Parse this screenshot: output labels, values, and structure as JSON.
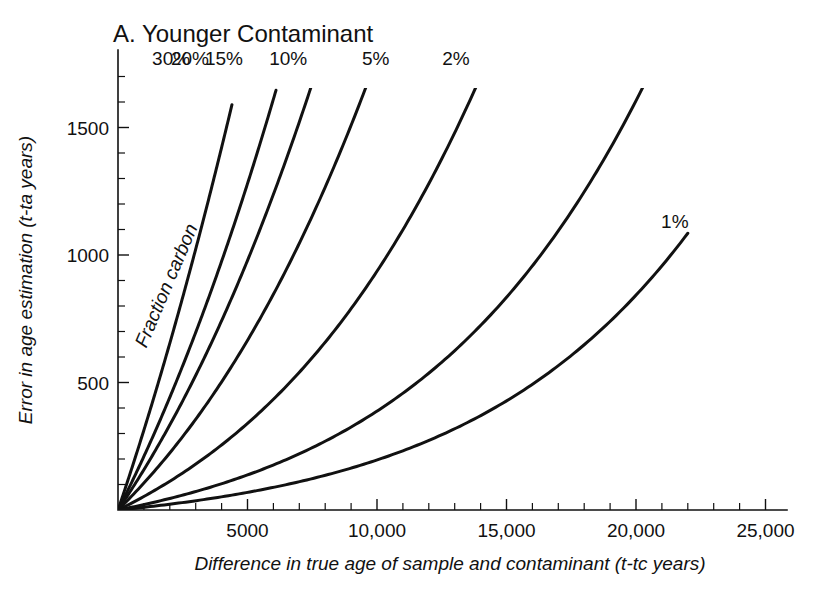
{
  "chart_data": {
    "type": "line",
    "title": "A. Younger Contaminant",
    "xlabel": "Difference in true age of sample and contaminant (t-tc years)",
    "ylabel": "Error in age estimation (t-ta years)",
    "xlim": [
      0,
      25800
    ],
    "ylim": [
      0,
      1750
    ],
    "xticks": [
      5000,
      10000,
      15000,
      20000,
      25000
    ],
    "xticklabels": [
      "5000",
      "10,000",
      "15,000",
      "20,000",
      "25,000"
    ],
    "yticks": [
      500,
      1000,
      1500
    ],
    "yticklabels": [
      "500",
      "1000",
      "1500"
    ],
    "x_minor_tick_step": 1000,
    "y_minor_tick_step": 100,
    "grid": false,
    "legend": "inline-curve-labels",
    "annotation": "Fraction carbon",
    "series_label_suffix": "%",
    "series": [
      {
        "name": "30%",
        "fraction": 0.3,
        "label": "30%",
        "label_x": 2050,
        "label_y": 1770,
        "end_x": 4400,
        "end_y": 1700,
        "values": [
          {
            "x": 0,
            "y": 0
          },
          {
            "x": 500,
            "y": 180
          },
          {
            "x": 1000,
            "y": 340
          },
          {
            "x": 1500,
            "y": 490
          },
          {
            "x": 2000,
            "y": 640
          },
          {
            "x": 2500,
            "y": 790
          },
          {
            "x": 3000,
            "y": 950
          },
          {
            "x": 3500,
            "y": 1120
          },
          {
            "x": 4000,
            "y": 1330
          },
          {
            "x": 4400,
            "y": 1700
          }
        ]
      },
      {
        "name": "20%",
        "fraction": 0.2,
        "label": "20%",
        "label_x": 2780,
        "label_y": 1770,
        "end_x": 6100,
        "end_y": 1700,
        "values": [
          {
            "x": 0,
            "y": 0
          },
          {
            "x": 1000,
            "y": 230
          },
          {
            "x": 2000,
            "y": 450
          },
          {
            "x": 3000,
            "y": 670
          },
          {
            "x": 3500,
            "y": 790
          },
          {
            "x": 4000,
            "y": 910
          },
          {
            "x": 4500,
            "y": 1040
          },
          {
            "x": 5000,
            "y": 1190
          },
          {
            "x": 5500,
            "y": 1370
          },
          {
            "x": 6100,
            "y": 1700
          }
        ]
      },
      {
        "name": "15%",
        "fraction": 0.15,
        "label": "15%",
        "label_x": 4090,
        "label_y": 1770,
        "end_x": 9300,
        "end_y": 1700,
        "values": [
          {
            "x": 0,
            "y": 0
          },
          {
            "x": 1000,
            "y": 160
          },
          {
            "x": 2000,
            "y": 320
          },
          {
            "x": 3000,
            "y": 480
          },
          {
            "x": 4000,
            "y": 640
          },
          {
            "x": 5000,
            "y": 800
          },
          {
            "x": 6000,
            "y": 960
          },
          {
            "x": 7000,
            "y": 1130
          },
          {
            "x": 8000,
            "y": 1320
          },
          {
            "x": 8700,
            "y": 1480
          },
          {
            "x": 9300,
            "y": 1700
          }
        ]
      },
      {
        "name": "10%",
        "fraction": 0.1,
        "label": "10%",
        "label_x": 6570,
        "label_y": 1770,
        "end_x": 13900,
        "end_y": 1700,
        "values": [
          {
            "x": 0,
            "y": 0
          },
          {
            "x": 2000,
            "y": 215
          },
          {
            "x": 4000,
            "y": 430
          },
          {
            "x": 6000,
            "y": 650
          },
          {
            "x": 8000,
            "y": 870
          },
          {
            "x": 10000,
            "y": 1100
          },
          {
            "x": 11500,
            "y": 1290
          },
          {
            "x": 12800,
            "y": 1490
          },
          {
            "x": 13900,
            "y": 1700
          }
        ]
      },
      {
        "name": "5%",
        "fraction": 0.05,
        "label": "5%",
        "label_x": 9950,
        "label_y": 1770,
        "end_x": 17400,
        "end_y": 1700,
        "values": [
          {
            "x": 0,
            "y": 0
          },
          {
            "x": 2500,
            "y": 185
          },
          {
            "x": 5000,
            "y": 375
          },
          {
            "x": 7500,
            "y": 570
          },
          {
            "x": 10000,
            "y": 780
          },
          {
            "x": 12500,
            "y": 1000
          },
          {
            "x": 14500,
            "y": 1200
          },
          {
            "x": 16000,
            "y": 1400
          },
          {
            "x": 17400,
            "y": 1700
          }
        ]
      },
      {
        "name": "2%",
        "fraction": 0.02,
        "label": "2%",
        "label_x": 13050,
        "label_y": 1770,
        "end_x": 20400,
        "end_y": 1700,
        "values": [
          {
            "x": 0,
            "y": 0
          },
          {
            "x": 3000,
            "y": 160
          },
          {
            "x": 6000,
            "y": 340
          },
          {
            "x": 9000,
            "y": 530
          },
          {
            "x": 12000,
            "y": 740
          },
          {
            "x": 15000,
            "y": 980
          },
          {
            "x": 17500,
            "y": 1210
          },
          {
            "x": 19200,
            "y": 1420
          },
          {
            "x": 20400,
            "y": 1700
          }
        ]
      },
      {
        "name": "1%",
        "fraction": 0.01,
        "label": "1%",
        "label_x": 21500,
        "label_y": 1130,
        "end_x": 22000,
        "end_y": 1070,
        "values": [
          {
            "x": 0,
            "y": 0
          },
          {
            "x": 2500,
            "y": 55
          },
          {
            "x": 5000,
            "y": 115
          },
          {
            "x": 7500,
            "y": 185
          },
          {
            "x": 10000,
            "y": 270
          },
          {
            "x": 12500,
            "y": 370
          },
          {
            "x": 15000,
            "y": 495
          },
          {
            "x": 17500,
            "y": 650
          },
          {
            "x": 19500,
            "y": 810
          },
          {
            "x": 21000,
            "y": 950
          },
          {
            "x": 22000,
            "y": 1070
          }
        ]
      }
    ]
  }
}
